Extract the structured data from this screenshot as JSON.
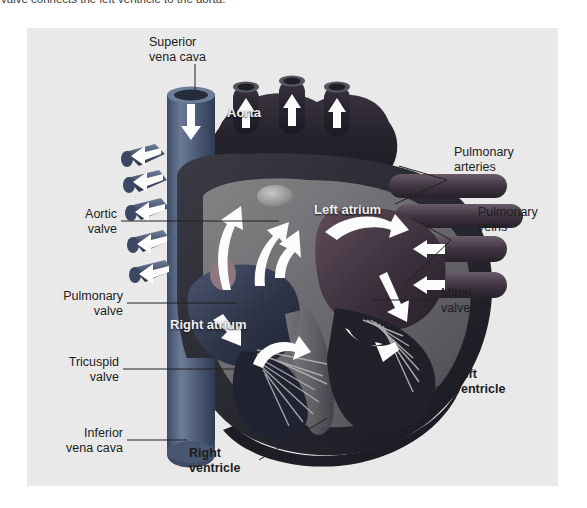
{
  "caption": {
    "text": "valve connects the left ventricle to the aorta."
  },
  "figure": {
    "background_color": "#ececec",
    "labels": {
      "superior_vena_cava": "Superior\nvena cava",
      "aorta": "Aorta",
      "pulmonary_arteries": "Pulmonary\narteries",
      "pulmonary_veins": "Pulmonary\nveins",
      "aortic_valve": "Aortic\nvalve",
      "pulmonary_valve": "Pulmonary\nvalve",
      "tricuspid_valve": "Tricuspid\nvalve",
      "mitral_valve": "Mitral\nvalve",
      "inferior_vena_cava": "Inferior\nvena cava",
      "left_atrium": "Left atrium",
      "right_atrium": "Right atrium",
      "left_ventricle": "Left\nventricle",
      "right_ventricle": "Right\nventricle"
    },
    "colors": {
      "deoxygenated_vessel": "#4a5a78",
      "oxygenated_vessel": "#5a4450",
      "myocardium_dark": "#2b2b33",
      "myocardium_mid": "#6e6e70",
      "chamber_dark": "#20202a",
      "flow_arrow": "#ffffff",
      "label_text": "#1a1a1a",
      "chamber_label_text": "#f2f2f2"
    }
  }
}
